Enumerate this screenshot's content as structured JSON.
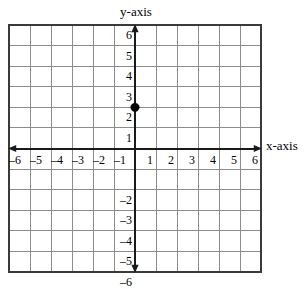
{
  "figure": {
    "type": "coordinate-plane",
    "y_axis_title": "y-axis",
    "x_axis_title": "x-axis"
  },
  "chart_data": {
    "type": "scatter",
    "title": "",
    "xlabel": "x-axis",
    "ylabel": "y-axis",
    "xlim": [
      -6,
      6
    ],
    "ylim": [
      -6,
      6
    ],
    "grid": true,
    "legend": "none",
    "x_tick_labels": [
      "–6",
      "–5",
      "–4",
      "–3",
      "–2",
      "–1",
      "1",
      "2",
      "3",
      "4",
      "5",
      "6"
    ],
    "x_tick_values": [
      -6,
      -5,
      -4,
      -3,
      -2,
      -1,
      1,
      2,
      3,
      4,
      5,
      6
    ],
    "y_tick_labels": [
      "6",
      "5",
      "4",
      "3",
      "2",
      "1",
      "–2",
      "–3",
      "–4",
      "–5",
      "–6"
    ],
    "y_tick_values": [
      6,
      5,
      4,
      3,
      2,
      1,
      -2,
      -3,
      -4,
      -5,
      -6
    ],
    "points": [
      {
        "x": 0,
        "y": 2,
        "label": ""
      }
    ],
    "series": [
      {
        "name": "plotted-point",
        "x": [
          0
        ],
        "y": [
          2
        ]
      }
    ]
  },
  "style": {
    "grid_line_color": "#8c8c8c",
    "grid_border_color": "#3a3a3a",
    "axis_color": "#1a1a1a",
    "point_color": "#000000",
    "background": "#ffffff"
  }
}
